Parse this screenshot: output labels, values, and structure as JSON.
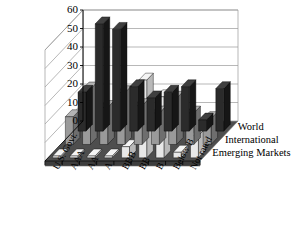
{
  "chart_data": {
    "type": "bar",
    "title": "",
    "subtitle": "",
    "xlabel": "",
    "ylabel": "",
    "ylim": [
      0,
      60
    ],
    "yticks": [
      0,
      10,
      20,
      30,
      40,
      50,
      60
    ],
    "grid": true,
    "legend_position": "right",
    "projection": "3d",
    "categories": [
      "U.S. Govt.",
      "AAA",
      "AA",
      "A",
      "BBB",
      "BB",
      "B",
      "Below B",
      "Not rated"
    ],
    "series": [
      {
        "name": "World",
        "color": "#2b2b2b",
        "values": [
          21,
          58,
          55,
          24,
          18,
          21,
          24,
          6,
          23
        ]
      },
      {
        "name": "International",
        "color": "#9a9a9a",
        "values": [
          15,
          30,
          20,
          28,
          21,
          17,
          25,
          17,
          14
        ]
      },
      {
        "name": "Emerging Markets",
        "color": "#e8e8e8",
        "values": [
          1,
          1,
          1,
          1,
          6,
          42,
          33,
          3,
          12
        ]
      }
    ]
  },
  "axis": {
    "y_tick_labels": [
      "60",
      "50",
      "40",
      "30",
      "20",
      "10",
      "0"
    ]
  },
  "legend": {
    "items": [
      {
        "label": "World"
      },
      {
        "label": "International"
      },
      {
        "label": "Emerging Markets"
      }
    ]
  },
  "colors": {
    "wall": "#ffffff",
    "wall_line": "#999999",
    "floor": "#4e4e4e",
    "floor_edge": "#6a6a6a",
    "axis": "#000000",
    "series_world": "#2b2b2b",
    "series_world_side": "#161616",
    "series_world_top": "#3f3f3f",
    "series_international": "#9a9a9a",
    "series_international_side": "#6e6e6e",
    "series_international_top": "#b4b4b4",
    "series_emerging": "#e8e8e8",
    "series_emerging_side": "#b9b9b9",
    "series_emerging_top": "#f4f4f4"
  }
}
